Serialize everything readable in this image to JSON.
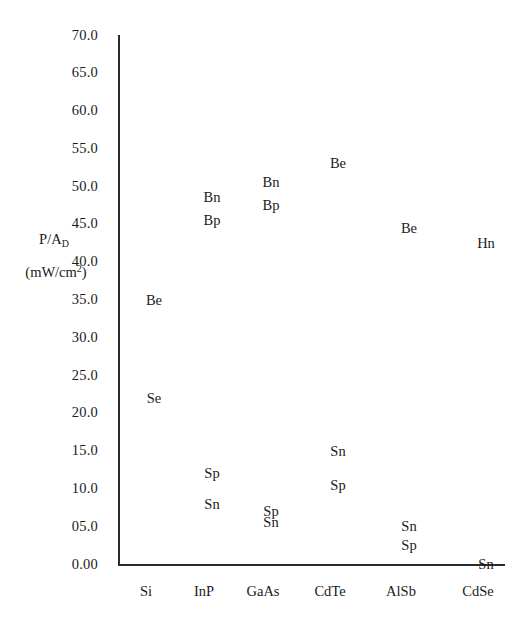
{
  "chart_data": {
    "type": "scatter",
    "title": "",
    "subtitle": "",
    "xlabel": "",
    "ylabel": "P/A_D (mW/cm^2)",
    "ylabel_main": "P/A",
    "ylabel_sub": "D",
    "ylabel_units": "(mW/cm",
    "ylabel_units_sup": "2",
    "ylabel_units_tail": ")",
    "grid": false,
    "legend": "none",
    "marker_style": "text-label-only",
    "ylim": [
      0,
      70
    ],
    "ytick_step": 5,
    "categories": [
      "Si",
      "InP",
      "GaAs",
      "CdTe",
      "AlSb",
      "CdSe"
    ],
    "ytick_labels": [
      "70.0",
      "65.0",
      "60.0",
      "55.0",
      "50.0",
      "45.0",
      "40.0",
      "35.0",
      "30.0",
      "25.0",
      "20.0",
      "15.0",
      "10.0",
      "05.0",
      "0.00"
    ],
    "ytick_values": [
      70,
      65,
      60,
      55,
      50,
      45,
      40,
      35,
      30,
      25,
      20,
      15,
      10,
      5,
      0
    ],
    "points": [
      {
        "category": "Si",
        "label": "Be",
        "value": 35.0
      },
      {
        "category": "Si",
        "label": "Se",
        "value": 22.0
      },
      {
        "category": "InP",
        "label": "Bn",
        "value": 48.5
      },
      {
        "category": "InP",
        "label": "Bp",
        "value": 45.5
      },
      {
        "category": "InP",
        "label": "Sp",
        "value": 12.0
      },
      {
        "category": "InP",
        "label": "Sn",
        "value": 8.0
      },
      {
        "category": "GaAs",
        "label": "Bn",
        "value": 50.5
      },
      {
        "category": "GaAs",
        "label": "Bp",
        "value": 47.5
      },
      {
        "category": "GaAs",
        "label": "Sp",
        "value": 7.0
      },
      {
        "category": "GaAs",
        "label": "Sn",
        "value": 5.5
      },
      {
        "category": "CdTe",
        "label": "Be",
        "value": 53.0
      },
      {
        "category": "CdTe",
        "label": "Sn",
        "value": 15.0
      },
      {
        "category": "CdTe",
        "label": "Sp",
        "value": 10.5
      },
      {
        "category": "AlSb",
        "label": "Be",
        "value": 44.5
      },
      {
        "category": "AlSb",
        "label": "Sn",
        "value": 5.0
      },
      {
        "category": "AlSb",
        "label": "Sp",
        "value": 2.5
      },
      {
        "category": "CdSe",
        "label": "Hn",
        "value": 42.5
      },
      {
        "category": "CdSe",
        "label": "Sn",
        "value": 0.0
      }
    ]
  },
  "geometry": {
    "plot_left": 118,
    "plot_right": 505,
    "plot_top": 35,
    "plot_bottom": 564,
    "category_x": [
      146,
      204,
      263,
      330,
      401,
      478
    ],
    "point_offset_x": 8
  }
}
